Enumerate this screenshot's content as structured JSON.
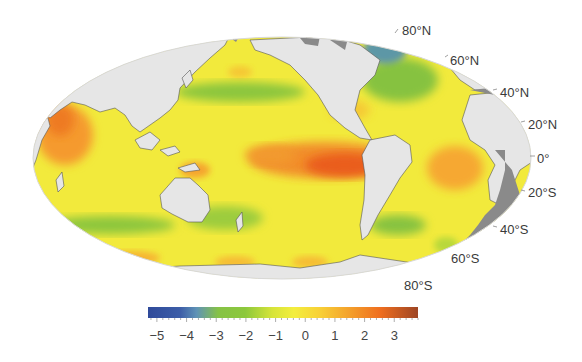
{
  "figure": {
    "projection": "Mollweide (Pacific-centered)",
    "land_color": "#e6e6e6",
    "coast_color": "#555555",
    "ice_color": "#8a8a8a",
    "ocean_base_color": "#f2ea3c"
  },
  "latitude_labels": [
    {
      "text": "80°N",
      "x": 402,
      "y": 24
    },
    {
      "text": "60°N",
      "x": 450,
      "y": 54
    },
    {
      "text": "40°N",
      "x": 500,
      "y": 86
    },
    {
      "text": "20°N",
      "x": 528,
      "y": 118
    },
    {
      "text": "0°",
      "x": 537,
      "y": 152
    },
    {
      "text": "20°S",
      "x": 528,
      "y": 186
    },
    {
      "text": "40°S",
      "x": 500,
      "y": 223
    },
    {
      "text": "60°S",
      "x": 451,
      "y": 252
    },
    {
      "text": "80°S",
      "x": 404,
      "y": 279
    }
  ],
  "colorbar": {
    "min": -5.3,
    "max": 3.8,
    "ticks": [
      "−5",
      "−4",
      "−3",
      "−2",
      "−1",
      "0",
      "1",
      "2",
      "3"
    ],
    "tick_values": [
      -5,
      -4,
      -3,
      -2,
      -1,
      0,
      1,
      2,
      3
    ],
    "colors": [
      "#2f4a9a",
      "#3a5aa6",
      "#5d8fb8",
      "#7fbf4a",
      "#8cc63c",
      "#c8dc3a",
      "#f1ec3d",
      "#f7c933",
      "#f4a52c",
      "#f07d22",
      "#e85a18",
      "#a84822"
    ]
  },
  "chart_data": {
    "type": "heatmap",
    "title": "",
    "projection": "Mollweide world map (Pacific-centered)",
    "latitude_labels": [
      "80°N",
      "60°N",
      "40°N",
      "20°N",
      "0°",
      "20°S",
      "40°S",
      "60°S",
      "80°S"
    ],
    "colorbar_ticks": [
      -5,
      -4,
      -3,
      -2,
      -1,
      0,
      1,
      2,
      3
    ],
    "colorbar_range": [
      -5.3,
      3.8
    ],
    "regions": [
      {
        "name": "Eastern equatorial Pacific",
        "approx_value": 2.8
      },
      {
        "name": "Central equatorial Pacific",
        "approx_value": 2.0
      },
      {
        "name": "Arabian Sea / western Indian Ocean",
        "approx_value": 2.0
      },
      {
        "name": "Equatorial Atlantic",
        "approx_value": 1.5
      },
      {
        "name": "New Guinea / Indonesian seas",
        "approx_value": 1.5
      },
      {
        "name": "Caribbean / Gulf of Mexico",
        "approx_value": 0.8
      },
      {
        "name": "North Pacific (Kuroshio extension band)",
        "approx_value": -2.5
      },
      {
        "name": "North Atlantic subpolar",
        "approx_value": -2.5
      },
      {
        "name": "Labrador Sea / Baffin Bay",
        "approx_value": -3.8
      },
      {
        "name": "Southern Indian Ocean band",
        "approx_value": -2.5
      },
      {
        "name": "Tasman / SW Pacific band",
        "approx_value": -2.3
      },
      {
        "name": "SW Atlantic (off Argentina)",
        "approx_value": -2.5
      },
      {
        "name": "Southern Ocean near Antarctica",
        "approx_value": 0.8
      },
      {
        "name": "Open ocean background",
        "approx_value": -0.3
      }
    ]
  }
}
